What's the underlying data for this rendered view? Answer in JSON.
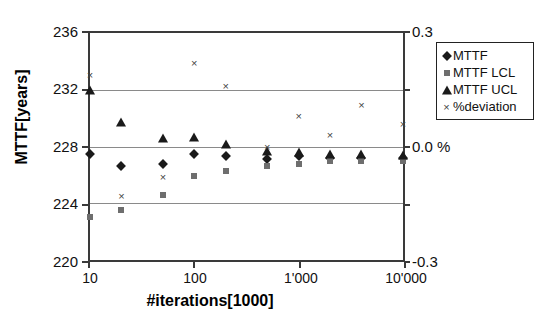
{
  "chart_data": {
    "type": "scatter",
    "title": "",
    "xlabel": "#iterations[1000]",
    "ylabel": "MTTF[years]",
    "ylabel_right": "%",
    "xscale": "log",
    "xlim": [
      10,
      10000
    ],
    "ylim": [
      220,
      236
    ],
    "ylim_right": [
      -0.3,
      0.3
    ],
    "grid": true,
    "legend_position": "outside-right-top",
    "x": [
      10,
      20,
      50,
      100,
      200,
      500,
      1000,
      2000,
      4000,
      10000
    ],
    "xticks": [
      "10",
      "100",
      "1'000",
      "10'000"
    ],
    "xtick_values": [
      10,
      100,
      1000,
      10000
    ],
    "yticks_left": [
      "236",
      "232",
      "228",
      "224",
      "220"
    ],
    "ytick_values_left": [
      236,
      232,
      228,
      224,
      220
    ],
    "yticks_right": [
      "0.3",
      "0.0 %",
      "-0.3"
    ],
    "ytick_values_right": [
      0.3,
      0.0,
      -0.3
    ],
    "series": [
      {
        "name": "MTTF",
        "marker": "diamond",
        "color": "#1a1a1a",
        "axis": "left",
        "values": [
          227.5,
          226.6,
          226.8,
          227.5,
          227.3,
          227.1,
          227.3,
          227.2,
          227.2,
          227.2
        ]
      },
      {
        "name": "MTTF LCL",
        "marker": "square",
        "color": "#6e6e6e",
        "axis": "left",
        "values": [
          223.0,
          223.5,
          224.6,
          225.9,
          226.3,
          226.6,
          226.8,
          227.0,
          227.0,
          227.0
        ]
      },
      {
        "name": "MTTF UCL",
        "marker": "triangle",
        "color": "#1a1a1a",
        "axis": "left",
        "values": [
          232.0,
          229.7,
          228.6,
          228.7,
          228.2,
          227.7,
          227.6,
          227.5,
          227.5,
          227.4
        ]
      },
      {
        "name": "%deviation",
        "marker": "cross",
        "color": "#444444",
        "axis": "right",
        "values": [
          0.19,
          -0.13,
          -0.08,
          0.22,
          0.16,
          0.0,
          0.08,
          0.03,
          0.11,
          0.06
        ]
      }
    ]
  },
  "axes": {
    "x_title": "#iterations[1000]",
    "y_title": "MTTF[years]",
    "xtick_labels": [
      "10",
      "100",
      "1'000",
      "10'000"
    ],
    "ytick_labels_left": [
      "236",
      "232",
      "228",
      "224",
      "220"
    ],
    "ytick_labels_right": [
      "0.3",
      "0.0 %",
      "-0.3"
    ]
  },
  "legend": {
    "items": [
      {
        "label": "MTTF",
        "marker": "diamond-icon"
      },
      {
        "label": "MTTF LCL",
        "marker": "square-icon"
      },
      {
        "label": "MTTF UCL",
        "marker": "triangle-icon"
      },
      {
        "label": "%deviation",
        "marker": "cross-icon"
      }
    ]
  }
}
